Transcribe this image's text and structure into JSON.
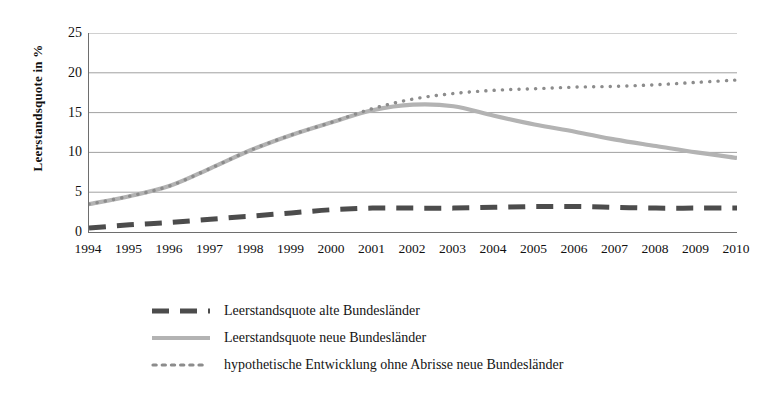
{
  "chart_data": {
    "type": "line",
    "title": "",
    "xlabel": "",
    "ylabel": "Leerstandsquote in %",
    "ylim": [
      0,
      25
    ],
    "yticks": [
      0,
      5,
      10,
      15,
      20,
      25
    ],
    "grid": true,
    "legend_position": "bottom",
    "categories": [
      "1994",
      "1995",
      "1996",
      "1997",
      "1998",
      "1999",
      "2000",
      "2001",
      "2002",
      "2003",
      "2004",
      "2005",
      "2006",
      "2007",
      "2008",
      "2009",
      "2010"
    ],
    "series": [
      {
        "name": "Leerstandsquote alte Bundesländer",
        "style": "dashed",
        "color": "#4c4c4c",
        "values": [
          0.5,
          0.9,
          1.2,
          1.6,
          2.0,
          2.4,
          2.8,
          3.0,
          3.0,
          3.0,
          3.1,
          3.2,
          3.2,
          3.1,
          3.0,
          3.0,
          3.0
        ]
      },
      {
        "name": "Leerstandsquote neue Bundesländer",
        "style": "solid",
        "color": "#b3b3b3",
        "values": [
          3.5,
          4.5,
          5.8,
          8.0,
          10.3,
          12.2,
          13.8,
          15.3,
          16.0,
          15.8,
          14.6,
          13.5,
          12.6,
          11.6,
          10.8,
          10.0,
          9.3
        ]
      },
      {
        "name": "hypothetische Entwicklung ohne Abrisse neue Bundesländer",
        "style": "dotted",
        "color": "#8c8c8c",
        "values": [
          3.5,
          4.5,
          5.8,
          8.0,
          10.3,
          12.2,
          13.8,
          15.5,
          16.7,
          17.4,
          17.8,
          18.0,
          18.2,
          18.3,
          18.5,
          18.8,
          19.1
        ]
      }
    ]
  },
  "axes": {
    "y_title": "Leerstandsquote in %",
    "y_tick_labels": [
      "25",
      "20",
      "15",
      "10",
      "5",
      "0"
    ],
    "x_tick_labels": [
      "1994",
      "1995",
      "1996",
      "1997",
      "1998",
      "1999",
      "2000",
      "2001",
      "2002",
      "2003",
      "2004",
      "2005",
      "2006",
      "2007",
      "2008",
      "2009",
      "2010"
    ]
  },
  "legend": {
    "items": [
      {
        "label": "Leerstandsquote alte Bundesländer",
        "marker": "dashed-line-swatch",
        "color": "#4c4c4c"
      },
      {
        "label": "Leerstandsquote neue Bundesländer",
        "marker": "solid-line-swatch",
        "color": "#b3b3b3"
      },
      {
        "label": "hypothetische Entwicklung ohne Abrisse neue Bundesländer",
        "marker": "dotted-line-swatch",
        "color": "#8c8c8c"
      }
    ]
  },
  "colors": {
    "alte_bundeslaender": "#4c4c4c",
    "neue_bundeslaender": "#b3b3b3",
    "hypothetisch": "#8c8c8c",
    "gridline": "#969696",
    "axis": "#6e6e6e",
    "text": "#111111",
    "background": "#ffffff"
  }
}
